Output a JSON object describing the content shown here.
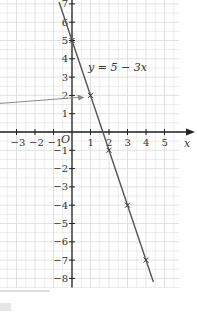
{
  "chart_data": {
    "type": "line",
    "title": "",
    "equation_label": "y = 5 − 3x",
    "xlabel": "x",
    "ylabel": "",
    "origin_label": "O",
    "xlim": [
      -3.9,
      5.8
    ],
    "ylim": [
      -8.5,
      7.3
    ],
    "x_ticks": [
      -3,
      -2,
      -1,
      1,
      2,
      3,
      4,
      5
    ],
    "y_ticks": [
      -8,
      -7,
      -6,
      -5,
      -4,
      -3,
      -2,
      -1,
      1,
      2,
      3,
      4,
      5,
      6,
      7
    ],
    "grid": true,
    "series": [
      {
        "name": "y = 5 - 3x",
        "x": [
          0,
          1,
          2,
          3,
          4
        ],
        "y": [
          5,
          2,
          -1,
          -4,
          -7
        ],
        "markers": "cross",
        "line_extent_x": [
          -0.7,
          4.4
        ]
      }
    ],
    "annotations": [
      {
        "type": "arrow",
        "from": "left edge",
        "to_point": [
          1,
          2
        ],
        "text": ""
      }
    ]
  },
  "colors": {
    "grid": "#d9d9d9",
    "axis": "#222222",
    "line": "#555555",
    "arrow": "#8a8a8a"
  }
}
